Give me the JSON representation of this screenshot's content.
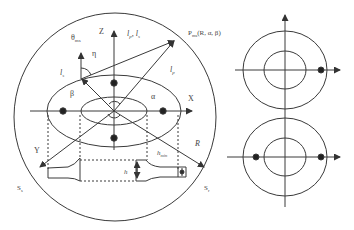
{
  "diagram": {
    "left": {
      "axes": {
        "z": "Z",
        "x": "X",
        "y": "Y",
        "r": "R"
      },
      "labels": {
        "theta": "θ",
        "theta_sub": "ms",
        "eta": "η",
        "beta": "β",
        "alpha": "α",
        "lp_ls": "l",
        "lp_ls_sub1": "p",
        "lp_ls_sep": ", ",
        "lp_ls_l2": "l",
        "lp_ls_sub2": "s",
        "ls": "l",
        "ls_sub": "s",
        "lp": "l",
        "lp_sub": "p",
        "point": "P",
        "point_sub": "ms",
        "point_args": "(R, α, β)",
        "h": "h",
        "hmin": "h",
        "hmin_sub": "min",
        "s_left": "S",
        "s_left_sub": "s",
        "s_right": "S",
        "s_right_sub": "r"
      }
    },
    "right": {
      "panels": [
        {
          "name": "upper",
          "dots": 1
        },
        {
          "name": "lower",
          "dots": 2
        }
      ]
    }
  },
  "colors": {
    "stroke": "#3a3a3a",
    "text": "#444444",
    "background": "#ffffff"
  }
}
